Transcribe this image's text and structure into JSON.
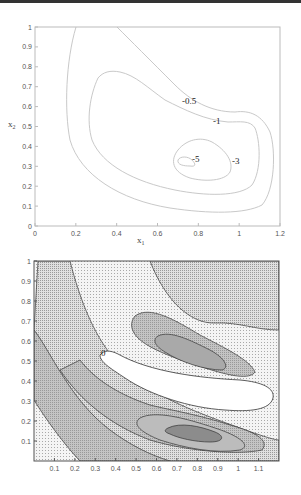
{
  "chart_data": [
    {
      "type": "contour",
      "title": "",
      "xlabel": "x1",
      "ylabel": "x2",
      "xlim": [
        0,
        1.2
      ],
      "ylim": [
        0,
        1
      ],
      "xticks": [
        "0",
        "0.2",
        "0.4",
        "0.6",
        "0.8",
        "1",
        "1.2"
      ],
      "yticks": [
        "0",
        "0.1",
        "0.2",
        "0.3",
        "0.4",
        "0.5",
        "0.6",
        "0.7",
        "0.8",
        "0.9",
        "1"
      ],
      "contour_levels": [
        -0.5,
        -1,
        -3,
        -5
      ],
      "contour_labels": [
        {
          "text": "-0.5",
          "x": 0.87,
          "y": 0.62
        },
        {
          "text": "-1",
          "x": 0.95,
          "y": 0.53
        },
        {
          "text": "-3",
          "x": 0.99,
          "y": 0.33
        },
        {
          "text": "-5",
          "x": 0.77,
          "y": 0.34
        }
      ],
      "minimum_approx": {
        "x1": 0.72,
        "x2": 0.33
      },
      "grid": false,
      "legend": null
    },
    {
      "type": "filled_contour",
      "title": "",
      "xlabel": "",
      "ylabel": "",
      "xlim": [
        0,
        1.2
      ],
      "ylim": [
        0,
        1
      ],
      "xticks": [
        "0.1",
        "0.2",
        "0.3",
        "0.4",
        "0.5",
        "0.6",
        "0.7",
        "0.8",
        "0.9",
        "1",
        "1.1"
      ],
      "yticks": [
        "0.1",
        "0.2",
        "0.3",
        "0.4",
        "0.5",
        "0.6",
        "0.7",
        "0.8",
        "0.9",
        "1"
      ],
      "contour_labels": [
        {
          "text": "0",
          "x": 0.35,
          "y": 0.53
        }
      ],
      "fill_style": "grayscale stipple/hatch shading by level",
      "grid": false,
      "legend": null
    }
  ],
  "top": {
    "xlabel": "x",
    "xlabel_sub": "1",
    "ylabel": "x",
    "ylabel_sub": "2",
    "xticks": [
      {
        "label": "0",
        "v": 0
      },
      {
        "label": "0.2",
        "v": 0.2
      },
      {
        "label": "0.4",
        "v": 0.4
      },
      {
        "label": "0.6",
        "v": 0.6
      },
      {
        "label": "0.8",
        "v": 0.8
      },
      {
        "label": "1",
        "v": 1
      },
      {
        "label": "1.2",
        "v": 1.2
      }
    ],
    "yticks": [
      {
        "label": "0",
        "v": 0
      },
      {
        "label": "0.1",
        "v": 0.1
      },
      {
        "label": "0.2",
        "v": 0.2
      },
      {
        "label": "0.3",
        "v": 0.3
      },
      {
        "label": "0.4",
        "v": 0.4
      },
      {
        "label": "0.5",
        "v": 0.5
      },
      {
        "label": "0.6",
        "v": 0.6
      },
      {
        "label": "0.7",
        "v": 0.7
      },
      {
        "label": "0.8",
        "v": 0.8
      },
      {
        "label": "0.9",
        "v": 0.9
      },
      {
        "label": "1",
        "v": 1
      }
    ],
    "labels": {
      "l05": "-0.5",
      "l1": "-1",
      "l3": "-3",
      "l5": "-5"
    }
  },
  "bottom": {
    "xticks": [
      {
        "label": "0.1",
        "v": 0.1
      },
      {
        "label": "0.2",
        "v": 0.2
      },
      {
        "label": "0.3",
        "v": 0.3
      },
      {
        "label": "0.4",
        "v": 0.4
      },
      {
        "label": "0.5",
        "v": 0.5
      },
      {
        "label": "0.6",
        "v": 0.6
      },
      {
        "label": "0.7",
        "v": 0.7
      },
      {
        "label": "0.8",
        "v": 0.8
      },
      {
        "label": "0.9",
        "v": 0.9
      },
      {
        "label": "1",
        "v": 1
      },
      {
        "label": "1.1",
        "v": 1.1
      }
    ],
    "yticks": [
      {
        "label": "0.1",
        "v": 0.1
      },
      {
        "label": "0.2",
        "v": 0.2
      },
      {
        "label": "0.3",
        "v": 0.3
      },
      {
        "label": "0.4",
        "v": 0.4
      },
      {
        "label": "0.5",
        "v": 0.5
      },
      {
        "label": "0.6",
        "v": 0.6
      },
      {
        "label": "0.7",
        "v": 0.7
      },
      {
        "label": "0.8",
        "v": 0.8
      },
      {
        "label": "0.9",
        "v": 0.9
      },
      {
        "label": "1",
        "v": 1
      }
    ],
    "labels": {
      "zero": "0"
    }
  },
  "colors": {
    "top_contour": "#c8c8c8",
    "axis_top": "#bbbbbb",
    "axis_bottom": "#555555",
    "shade_light": "#eeeeee",
    "shade_mid": "#d6d6d6",
    "shade_dark": "#bdbdbd",
    "shade_darkest": "#8e8e8e"
  }
}
